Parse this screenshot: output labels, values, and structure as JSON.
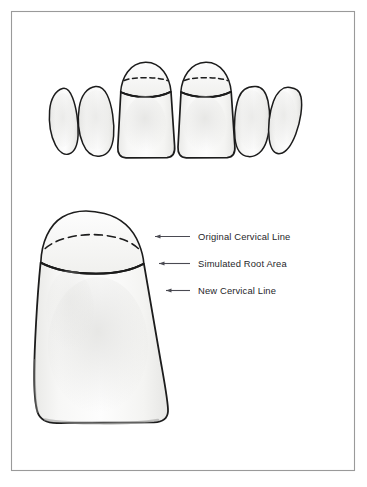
{
  "figure": {
    "frame": {
      "border_color": "#9a9a9a",
      "background_color": "#ffffff"
    },
    "colors": {
      "outline": "#1c1c1c",
      "tooth_fill": "#fbfbfb",
      "shade_light": "#f2f2f0",
      "shade_mid": "#e7e7e5",
      "leader_line": "#4a4a52",
      "label_text": "#26262a",
      "dashed_line": "#1c1c1c"
    }
  },
  "upper_arch": {
    "name": "anterior-tooth-row",
    "description": "Six anterior teeth viewed from the facial aspect",
    "teeth": [
      {
        "id": "canine-left",
        "label": "Canine",
        "has_simulated_root": false
      },
      {
        "id": "lateral-incisor-left",
        "label": "Lateral Incisor",
        "has_simulated_root": false
      },
      {
        "id": "central-incisor-left",
        "label": "Central Incisor",
        "has_simulated_root": true
      },
      {
        "id": "central-incisor-right",
        "label": "Central Incisor",
        "has_simulated_root": true
      },
      {
        "id": "lateral-incisor-right",
        "label": "Lateral Incisor",
        "has_simulated_root": false
      },
      {
        "id": "canine-right",
        "label": "Canine",
        "has_simulated_root": false
      }
    ]
  },
  "detail_tooth": {
    "name": "enlarged-central-incisor",
    "description": "Enlarged single central incisor with simulated root area"
  },
  "annotations": [
    {
      "id": "original-cervical-line",
      "label": "Original Cervical Line",
      "line_style": "dashed",
      "leader_y": 236
    },
    {
      "id": "simulated-root-area",
      "label": "Simulated Root Area",
      "line_style": "region",
      "leader_y": 263
    },
    {
      "id": "new-cervical-line",
      "label": "New Cervical Line",
      "line_style": "solid",
      "leader_y": 290
    }
  ]
}
